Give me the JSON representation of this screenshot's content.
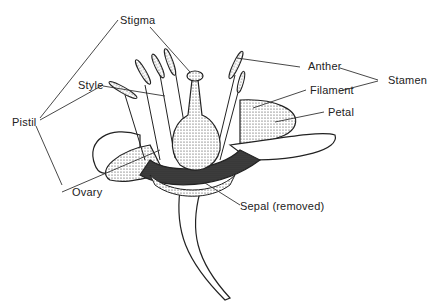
{
  "diagram": {
    "labels": {
      "stigma": "Stigma",
      "style": "Style",
      "pistil": "Pistil",
      "ovary": "Ovary",
      "anther": "Anther",
      "filament": "Filament",
      "stamen": "Stamen",
      "petal": "Petal",
      "sepal": "Sepal (removed)"
    },
    "colors": {
      "ink": "#222222",
      "background": "#ffffff"
    }
  }
}
